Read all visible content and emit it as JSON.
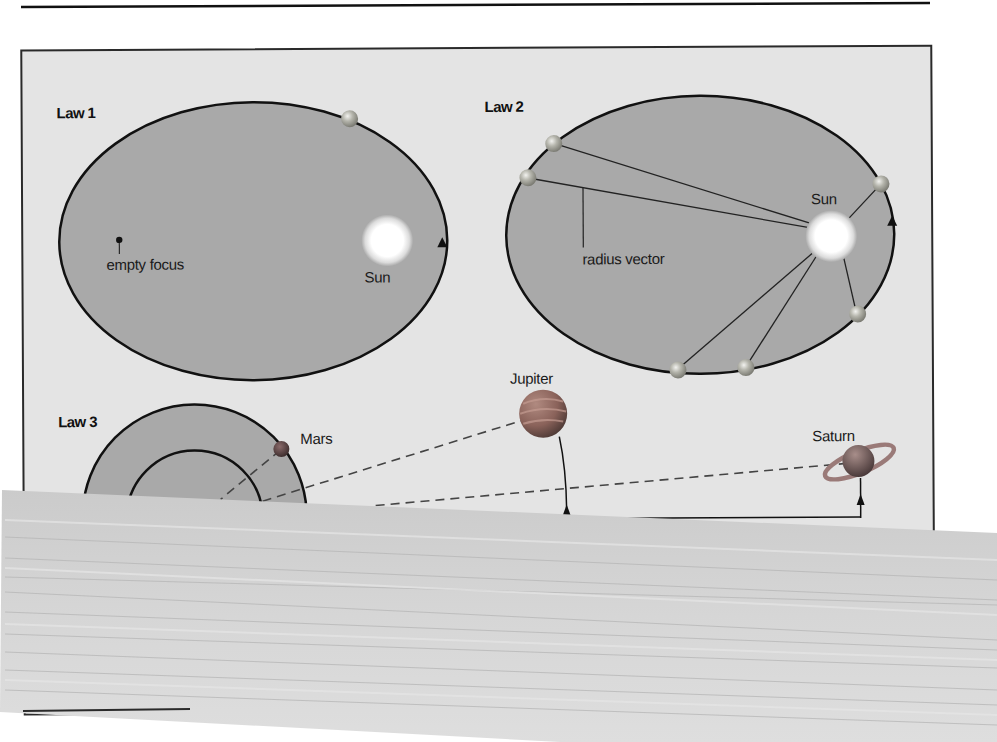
{
  "figure": {
    "colors": {
      "page_background": "#ffffff",
      "panel_background": "#e4e4e4",
      "orbit_fill": "#a9a9a9",
      "orbit_stroke": "#111111",
      "sun_core": "#ffffff",
      "sun_halo": "#bdbdbd",
      "planet_small": "#9a9a9a",
      "mars": "#5a4a4a",
      "jupiter": "#8a6660",
      "saturn": "#7a6868",
      "smear_band": "#d2d2d2"
    }
  },
  "law1": {
    "label": "Law 1",
    "focus_label": "empty focus",
    "sun_label": "Sun"
  },
  "law2": {
    "label": "Law 2",
    "sun_label": "Sun",
    "vector_label": "radius vector"
  },
  "law3": {
    "label": "Law 3",
    "planets": [
      {
        "name": "Mars"
      },
      {
        "name": "Jupiter"
      },
      {
        "name": "Saturn"
      }
    ]
  }
}
